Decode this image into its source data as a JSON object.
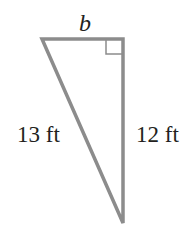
{
  "diagram": {
    "type": "right-triangle",
    "labels": {
      "top_side": "b",
      "hypotenuse": "13 ft",
      "vertical_side": "12 ft"
    },
    "right_angle_marker": true,
    "colors": {
      "stroke": "#8c8c8c",
      "text": "#231f20",
      "background": "#ffffff"
    }
  }
}
